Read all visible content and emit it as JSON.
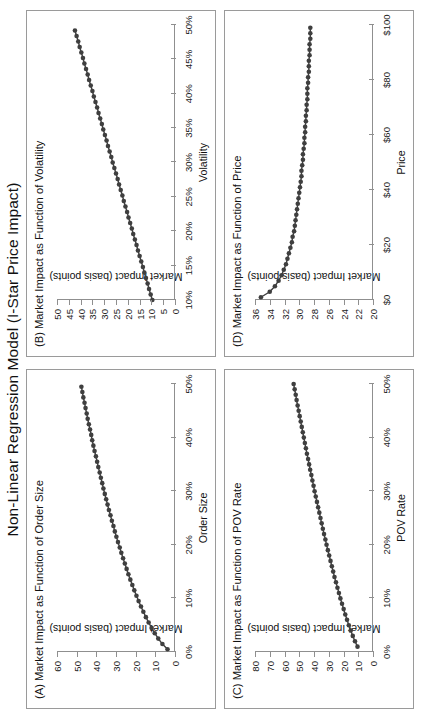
{
  "figure": {
    "title": "Non-Linear Regression Model (I-Star Price Impact)",
    "marker_color": "#3f3f3f",
    "axis_color": "#8f8f8f",
    "panel_border_color": "#9a9a9a"
  },
  "chart_data": [
    {
      "id": "panel-a",
      "type": "scatter",
      "title": "(A) Market Impact as Function of Order Size",
      "xlabel": "Order Size",
      "ylabel": "Market Impact (basis points)",
      "xlim": [
        0,
        50
      ],
      "ylim": [
        0,
        60
      ],
      "xticks": [
        0,
        10,
        20,
        30,
        40,
        50
      ],
      "xticklabels": [
        "0%",
        "10%",
        "20%",
        "30%",
        "40%",
        "50%"
      ],
      "yticks": [
        0,
        10,
        20,
        30,
        40,
        50,
        60
      ],
      "yticklabels": [
        "0",
        "10",
        "20",
        "30",
        "40",
        "50",
        "60"
      ],
      "grid": false,
      "legend": "none",
      "x": [
        0.5,
        1.5,
        2.5,
        3.5,
        4.5,
        5.5,
        6.5,
        7.5,
        8.5,
        9.5,
        10.5,
        11.5,
        12.5,
        13.5,
        14.5,
        15.5,
        16.5,
        17.5,
        18.5,
        19.5,
        20.5,
        21.5,
        22.5,
        23.5,
        24.5,
        25.5,
        26.5,
        27.5,
        28.5,
        29.5,
        30.5,
        31.5,
        32.5,
        33.5,
        34.5,
        35.5,
        36.5,
        37.5,
        38.5,
        39.5,
        40.5,
        41.5,
        42.5,
        43.5,
        44.5,
        45.5,
        46.5,
        47.5,
        48.5,
        49.5
      ],
      "y": [
        3.8,
        6.4,
        8.5,
        10.3,
        11.9,
        13.4,
        14.8,
        16.1,
        17.3,
        18.5,
        19.6,
        20.7,
        21.7,
        22.7,
        23.7,
        24.6,
        25.5,
        26.4,
        27.3,
        28.1,
        29.0,
        29.8,
        30.6,
        31.3,
        32.1,
        32.8,
        33.6,
        34.3,
        35.0,
        35.7,
        36.4,
        37.0,
        37.7,
        38.3,
        39.0,
        39.6,
        40.2,
        40.9,
        41.5,
        42.1,
        42.6,
        43.2,
        43.8,
        44.4,
        44.9,
        45.5,
        46.0,
        46.6,
        47.1,
        47.6
      ]
    },
    {
      "id": "panel-b",
      "type": "scatter",
      "title": "(B) Market Impact as Function of Volatility",
      "xlabel": "Volatility",
      "ylabel": "Market Impact (basis points)",
      "xlim": [
        10,
        50
      ],
      "ylim": [
        0,
        50
      ],
      "xticks": [
        10,
        15,
        20,
        25,
        30,
        35,
        40,
        45,
        50
      ],
      "xticklabels": [
        "10%",
        "15%",
        "20%",
        "25%",
        "30%",
        "35%",
        "40%",
        "45%",
        "50%"
      ],
      "yticks": [
        0,
        5,
        10,
        15,
        20,
        25,
        30,
        35,
        40,
        45,
        50
      ],
      "yticklabels": [
        "0",
        "5",
        "10",
        "15",
        "20",
        "25",
        "30",
        "35",
        "40",
        "45",
        "50"
      ],
      "grid": false,
      "legend": "none",
      "x": [
        10.0,
        10.8,
        11.6,
        12.4,
        13.2,
        14.0,
        14.8,
        15.6,
        16.4,
        17.2,
        18.0,
        18.8,
        19.6,
        20.4,
        21.2,
        22.0,
        22.8,
        23.6,
        24.4,
        25.2,
        26.0,
        26.8,
        27.6,
        28.4,
        29.2,
        30.0,
        30.8,
        31.6,
        32.4,
        33.2,
        34.0,
        34.8,
        35.6,
        36.4,
        37.2,
        38.0,
        38.8,
        39.6,
        40.4,
        41.2,
        42.0,
        42.8,
        43.6,
        44.4,
        45.2,
        46.0,
        46.8,
        47.6,
        48.4,
        49.2
      ],
      "y": [
        9.6,
        10.3,
        11.0,
        11.6,
        12.3,
        13.0,
        13.6,
        14.3,
        15.0,
        15.7,
        16.3,
        17.0,
        17.7,
        18.3,
        19.0,
        19.7,
        20.3,
        21.0,
        21.7,
        22.3,
        23.0,
        23.7,
        24.3,
        25.0,
        25.7,
        26.4,
        27.0,
        27.7,
        28.4,
        29.0,
        29.7,
        30.4,
        31.0,
        31.7,
        32.4,
        33.0,
        33.7,
        34.4,
        35.0,
        35.7,
        36.4,
        37.0,
        37.7,
        38.4,
        39.0,
        39.7,
        40.4,
        41.0,
        41.7,
        42.4
      ]
    },
    {
      "id": "panel-c",
      "type": "scatter",
      "title": "(C) Market Impact as Function of POV Rate",
      "xlabel": "POV Rate",
      "ylabel": "Market Impact (basis points)",
      "xlim": [
        0,
        50
      ],
      "ylim": [
        0,
        80
      ],
      "xticks": [
        0,
        10,
        20,
        30,
        40,
        50
      ],
      "xticklabels": [
        "0%",
        "10%",
        "20%",
        "30%",
        "40%",
        "50%"
      ],
      "yticks": [
        0,
        10,
        20,
        30,
        40,
        50,
        60,
        70,
        80
      ],
      "yticklabels": [
        "0",
        "10",
        "20",
        "30",
        "40",
        "50",
        "60",
        "70",
        "80"
      ],
      "grid": false,
      "legend": "none",
      "x": [
        1.0,
        2.0,
        3.0,
        4.0,
        5.0,
        6.0,
        7.0,
        8.0,
        9.0,
        10.0,
        11.0,
        12.0,
        13.0,
        14.0,
        15.0,
        16.0,
        17.0,
        18.0,
        19.0,
        20.0,
        21.0,
        22.0,
        23.0,
        24.0,
        25.0,
        26.0,
        27.0,
        28.0,
        29.0,
        30.0,
        31.0,
        32.0,
        33.0,
        34.0,
        35.0,
        36.0,
        37.0,
        38.0,
        39.0,
        40.0,
        41.0,
        42.0,
        43.0,
        44.0,
        45.0,
        46.0,
        47.0,
        48.0,
        49.0,
        50.0
      ],
      "y": [
        10.5,
        12.2,
        13.7,
        15.1,
        16.4,
        17.6,
        18.8,
        19.9,
        21.0,
        22.1,
        23.1,
        24.1,
        25.1,
        26.1,
        27.0,
        27.9,
        28.8,
        29.7,
        30.6,
        31.5,
        32.3,
        33.2,
        34.0,
        34.8,
        35.6,
        36.4,
        37.2,
        38.0,
        38.8,
        39.6,
        40.3,
        41.1,
        41.8,
        42.6,
        43.3,
        44.0,
        44.8,
        45.5,
        46.2,
        46.9,
        47.6,
        48.3,
        49.0,
        49.7,
        50.4,
        51.1,
        51.8,
        52.4,
        53.1,
        53.8
      ]
    },
    {
      "id": "panel-d",
      "type": "scatter",
      "title": "(D) Market Impact as Function of Price",
      "xlabel": "Price",
      "ylabel": "Market Impact (basis points)",
      "xlim": [
        0,
        100
      ],
      "ylim": [
        20,
        36
      ],
      "xticks": [
        0,
        20,
        40,
        60,
        80,
        100
      ],
      "xticklabels": [
        "$0",
        "$20",
        "$40",
        "$60",
        "$80",
        "$100"
      ],
      "yticks": [
        20,
        22,
        24,
        26,
        28,
        30,
        32,
        34,
        36
      ],
      "yticklabels": [
        "20",
        "22",
        "24",
        "26",
        "28",
        "30",
        "32",
        "34",
        "36"
      ],
      "grid": false,
      "legend": "none",
      "x": [
        1,
        3,
        5,
        7,
        9,
        11,
        13,
        15,
        17,
        19,
        21,
        23,
        25,
        27,
        29,
        31,
        33,
        35,
        37,
        39,
        41,
        43,
        45,
        47,
        49,
        51,
        53,
        55,
        57,
        59,
        61,
        63,
        65,
        67,
        69,
        71,
        73,
        75,
        77,
        79,
        81,
        83,
        85,
        87,
        89,
        91,
        93,
        95,
        97,
        99
      ],
      "y": [
        35.2,
        34.0,
        33.3,
        32.8,
        32.4,
        32.1,
        31.8,
        31.6,
        31.4,
        31.2,
        31.0,
        30.9,
        30.7,
        30.6,
        30.5,
        30.4,
        30.3,
        30.2,
        30.1,
        30.0,
        29.9,
        29.8,
        29.7,
        29.7,
        29.6,
        29.5,
        29.5,
        29.4,
        29.3,
        29.3,
        29.2,
        29.2,
        29.1,
        29.1,
        29.0,
        29.0,
        28.9,
        28.9,
        28.9,
        28.8,
        28.8,
        28.7,
        28.7,
        28.7,
        28.6,
        28.6,
        28.6,
        28.5,
        28.5,
        28.5
      ]
    }
  ]
}
